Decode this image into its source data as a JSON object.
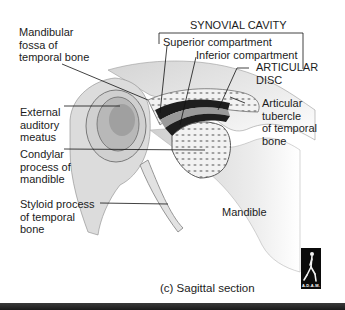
{
  "figure": {
    "caption": "(c) Sagittal section",
    "bracket_title": "SYNOVIAL CAVITY",
    "labels": {
      "mandibular_fossa": "Mandibular\nfossa of\ntemporal bone",
      "superior_compartment": "Superior compartment",
      "inferior_compartment": "Inferior compartment",
      "articular_disc": "ARTICULAR\nDISC",
      "articular_tubercle": "Articular\ntubercle\nof temporal\nbone",
      "external_auditory_meatus": "External\nauditory\nmeatus",
      "condylar_process": "Condylar\nprocess of\nmandible",
      "styloid_process": "Styloid process\nof temporal\nbone",
      "mandible": "Mandible"
    },
    "logo_text": "A.D.A.M.",
    "colors": {
      "bone": "#e6e6e6",
      "bone_shade": "#bdbdbd",
      "cavity": "#1e1e1e",
      "disc": "#9a9a9a",
      "leader": "#111111",
      "bar": "#2a2a2a"
    }
  }
}
